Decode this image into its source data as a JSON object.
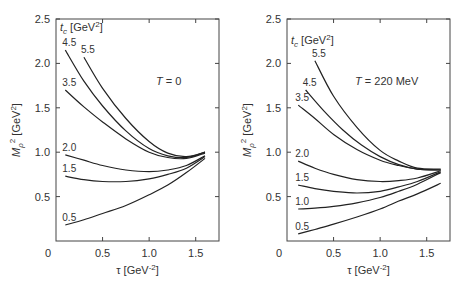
{
  "chart_data": [
    {
      "type": "line",
      "title": "",
      "annotation": "T = 0",
      "legend_title": "t_c [GeV^2]",
      "xlabel": "τ [GeV^-2]",
      "ylabel": "M_ρ^2 [GeV^2]",
      "xlim": [
        0,
        1.75
      ],
      "ylim": [
        0,
        2.5
      ],
      "xticks": [
        "0",
        "0.5",
        "1.0",
        "1.5"
      ],
      "yticks": [
        "0.5",
        "1.0",
        "1.5",
        "2.0",
        "2.5"
      ],
      "grid": false,
      "series": [
        {
          "name": "5.5",
          "x": [
            0.3,
            0.5,
            0.75,
            1.0,
            1.2,
            1.4,
            1.6
          ],
          "y": [
            2.07,
            1.72,
            1.38,
            1.12,
            0.99,
            0.95,
            1.0
          ]
        },
        {
          "name": "4.5",
          "x": [
            0.1,
            0.3,
            0.5,
            0.75,
            1.0,
            1.2,
            1.4,
            1.6
          ],
          "y": [
            2.15,
            1.8,
            1.52,
            1.24,
            1.04,
            0.96,
            0.94,
            1.0
          ]
        },
        {
          "name": "3.5",
          "x": [
            0.1,
            0.3,
            0.5,
            0.75,
            1.0,
            1.2,
            1.4,
            1.6
          ],
          "y": [
            1.7,
            1.51,
            1.34,
            1.15,
            1.0,
            0.94,
            0.93,
            0.99
          ]
        },
        {
          "name": "2.0",
          "x": [
            0.1,
            0.3,
            0.5,
            0.75,
            1.0,
            1.2,
            1.4,
            1.6
          ],
          "y": [
            0.97,
            0.91,
            0.85,
            0.8,
            0.78,
            0.8,
            0.85,
            0.96
          ]
        },
        {
          "name": "1.5",
          "x": [
            0.1,
            0.3,
            0.5,
            0.75,
            1.0,
            1.2,
            1.4,
            1.6
          ],
          "y": [
            0.73,
            0.69,
            0.67,
            0.67,
            0.7,
            0.75,
            0.82,
            0.95
          ]
        },
        {
          "name": "0.5",
          "x": [
            0.1,
            0.3,
            0.5,
            0.75,
            1.0,
            1.2,
            1.4,
            1.6
          ],
          "y": [
            0.18,
            0.24,
            0.31,
            0.4,
            0.52,
            0.63,
            0.77,
            0.93
          ]
        }
      ]
    },
    {
      "type": "line",
      "title": "",
      "annotation": "T = 220 MeV",
      "legend_title": "t_c [GeV^2]",
      "xlabel": "τ [GeV^-2]",
      "ylabel": "M_ρ^2 [GeV^2]",
      "xlim": [
        0,
        1.75
      ],
      "ylim": [
        0,
        2.5
      ],
      "xticks": [
        "0",
        "0.5",
        "1.0",
        "1.5"
      ],
      "yticks": [
        "0.5",
        "1.0",
        "1.5",
        "2.0",
        "2.5"
      ],
      "grid": false,
      "series": [
        {
          "name": "5.5",
          "x": [
            0.3,
            0.5,
            0.75,
            1.0,
            1.2,
            1.4,
            1.65
          ],
          "y": [
            2.03,
            1.63,
            1.28,
            1.02,
            0.9,
            0.82,
            0.81
          ]
        },
        {
          "name": "4.5",
          "x": [
            0.2,
            0.4,
            0.6,
            0.8,
            1.0,
            1.2,
            1.4,
            1.65
          ],
          "y": [
            1.7,
            1.46,
            1.25,
            1.08,
            0.95,
            0.86,
            0.81,
            0.8
          ]
        },
        {
          "name": "3.5",
          "x": [
            0.12,
            0.3,
            0.5,
            0.75,
            1.0,
            1.2,
            1.4,
            1.65
          ],
          "y": [
            1.53,
            1.38,
            1.2,
            1.03,
            0.91,
            0.85,
            0.81,
            0.8
          ]
        },
        {
          "name": "2.0",
          "x": [
            0.12,
            0.3,
            0.5,
            0.75,
            1.0,
            1.2,
            1.4,
            1.65
          ],
          "y": [
            0.9,
            0.82,
            0.75,
            0.69,
            0.67,
            0.68,
            0.71,
            0.79
          ]
        },
        {
          "name": "1.5",
          "x": [
            0.12,
            0.3,
            0.5,
            0.75,
            1.0,
            1.2,
            1.4,
            1.65
          ],
          "y": [
            0.63,
            0.59,
            0.56,
            0.54,
            0.56,
            0.61,
            0.67,
            0.78
          ]
        },
        {
          "name": "1.0",
          "x": [
            0.12,
            0.3,
            0.5,
            0.75,
            1.0,
            1.2,
            1.4,
            1.65
          ],
          "y": [
            0.36,
            0.37,
            0.39,
            0.43,
            0.49,
            0.56,
            0.64,
            0.77
          ]
        },
        {
          "name": "0.5",
          "x": [
            0.12,
            0.3,
            0.5,
            0.75,
            1.0,
            1.2,
            1.4,
            1.65
          ],
          "y": [
            0.08,
            0.13,
            0.19,
            0.27,
            0.36,
            0.45,
            0.53,
            0.65
          ]
        }
      ]
    }
  ],
  "layout": {
    "panels": [
      {
        "x0": 56,
        "x1": 219,
        "y0": 19,
        "y1": 241
      },
      {
        "x0": 287,
        "x1": 450,
        "y0": 19,
        "y1": 241
      }
    ]
  }
}
